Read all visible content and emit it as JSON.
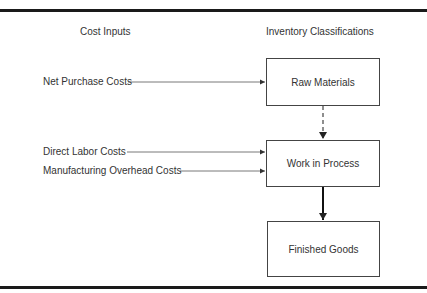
{
  "diagram": {
    "headers": {
      "left": "Cost Inputs",
      "right": "Inventory Classifications"
    },
    "inputs": [
      {
        "label": "Net Purchase Costs",
        "target": "raw_materials"
      },
      {
        "label": "Direct Labor Costs",
        "target": "work_in_process"
      },
      {
        "label": "Manufacturing Overhead Costs",
        "target": "work_in_process"
      }
    ],
    "boxes": {
      "raw_materials": "Raw Materials",
      "work_in_process": "Work in Process",
      "finished_goods": "Finished Goods"
    },
    "flows": [
      {
        "from": "raw_materials",
        "to": "work_in_process",
        "style": "dashed"
      },
      {
        "from": "work_in_process",
        "to": "finished_goods",
        "style": "bold"
      }
    ],
    "colors": {
      "line": "#444444",
      "text": "#333333",
      "rule": "#1a1a1a"
    }
  }
}
